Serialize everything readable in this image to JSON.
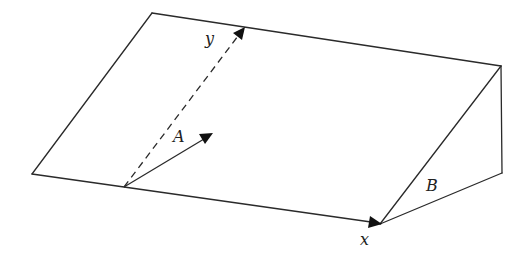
{
  "diagram": {
    "labels": {
      "y": "y",
      "A": "A",
      "B": "B",
      "x": "x"
    },
    "vertices": {
      "bottom_left": [
        32,
        174
      ],
      "top_left": [
        152,
        13
      ],
      "top_right": [
        501,
        66
      ],
      "back_bottom_right": [
        502,
        173
      ],
      "front_bottom_right": [
        380,
        224
      ],
      "vector_origin": [
        124,
        187
      ]
    },
    "vectors": [
      {
        "name": "y-axis",
        "from": [
          124,
          187
        ],
        "to": [
          244,
          28
        ],
        "style": "dashed"
      },
      {
        "name": "A",
        "from": [
          124,
          187
        ],
        "to": [
          212,
          134
        ],
        "style": "solid"
      },
      {
        "name": "x-axis",
        "from": [
          124,
          187
        ],
        "to": [
          380,
          224
        ],
        "style": "solid"
      }
    ],
    "colors": {
      "line": "#2a2a2a",
      "arrow": "#111111",
      "background": "#ffffff"
    }
  }
}
